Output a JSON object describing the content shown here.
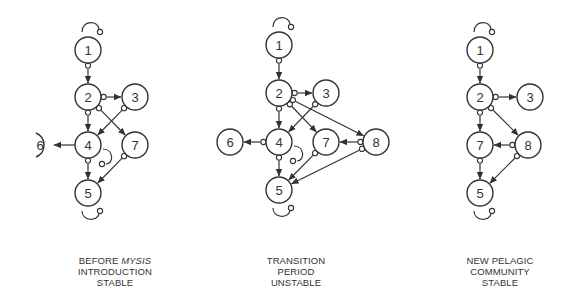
{
  "panels": [
    {
      "id": "before",
      "caption": {
        "line1_prefix": "BEFORE ",
        "line1_italic": "MYSIS",
        "line2": "INTRODUCTION",
        "line3": "STABLE"
      },
      "nodes": [
        {
          "id": "1",
          "x": 88,
          "y": 50
        },
        {
          "id": "2",
          "x": 88,
          "y": 97
        },
        {
          "id": "3",
          "x": 135,
          "y": 97
        },
        {
          "id": "4",
          "x": 88,
          "y": 145
        },
        {
          "id": "6",
          "x": 40,
          "y": 145,
          "partial": true
        },
        {
          "id": "7",
          "x": 135,
          "y": 145
        },
        {
          "id": "5",
          "x": 88,
          "y": 193
        }
      ],
      "edges": [
        {
          "from": "1",
          "to": "2"
        },
        {
          "from": "2",
          "to": "3"
        },
        {
          "from": "2",
          "to": "4"
        },
        {
          "from": "2",
          "to": "7"
        },
        {
          "from": "3",
          "to": "4"
        },
        {
          "from": "4",
          "to": "6",
          "no_tail": true
        },
        {
          "from": "4",
          "to": "5"
        },
        {
          "from": "7",
          "to": "5"
        }
      ],
      "self_loops": [
        "1",
        "4",
        "5"
      ]
    },
    {
      "id": "transition",
      "caption": {
        "line1": "TRANSITION",
        "line2": "PERIOD",
        "line3": "UNSTABLE"
      },
      "nodes": [
        {
          "id": "1",
          "x": 279,
          "y": 45
        },
        {
          "id": "2",
          "x": 279,
          "y": 93
        },
        {
          "id": "3",
          "x": 326,
          "y": 93
        },
        {
          "id": "4",
          "x": 279,
          "y": 142
        },
        {
          "id": "6",
          "x": 230,
          "y": 142
        },
        {
          "id": "7",
          "x": 326,
          "y": 142
        },
        {
          "id": "8",
          "x": 376,
          "y": 142
        },
        {
          "id": "5",
          "x": 279,
          "y": 190
        }
      ],
      "edges": [
        {
          "from": "1",
          "to": "2"
        },
        {
          "from": "2",
          "to": "3"
        },
        {
          "from": "2",
          "to": "4"
        },
        {
          "from": "2",
          "to": "7"
        },
        {
          "from": "2",
          "to": "8"
        },
        {
          "from": "3",
          "to": "4"
        },
        {
          "from": "4",
          "to": "6"
        },
        {
          "from": "4",
          "to": "5"
        },
        {
          "from": "8",
          "to": "7"
        },
        {
          "from": "7",
          "to": "5"
        },
        {
          "from": "8",
          "to": "5"
        }
      ],
      "self_loops": [
        "1",
        "4",
        "5"
      ]
    },
    {
      "id": "after",
      "caption": {
        "line1": "NEW PELAGIC",
        "line2": "COMMUNITY",
        "line3": "STABLE"
      },
      "nodes": [
        {
          "id": "1",
          "x": 480,
          "y": 50
        },
        {
          "id": "2",
          "x": 480,
          "y": 97
        },
        {
          "id": "3",
          "x": 530,
          "y": 97
        },
        {
          "id": "7",
          "x": 480,
          "y": 145
        },
        {
          "id": "8",
          "x": 528,
          "y": 145
        },
        {
          "id": "5",
          "x": 480,
          "y": 193
        }
      ],
      "edges": [
        {
          "from": "1",
          "to": "2"
        },
        {
          "from": "2",
          "to": "3"
        },
        {
          "from": "2",
          "to": "7"
        },
        {
          "from": "2",
          "to": "8"
        },
        {
          "from": "8",
          "to": "7"
        },
        {
          "from": "7",
          "to": "5"
        },
        {
          "from": "8",
          "to": "5"
        }
      ],
      "self_loops": [
        "1",
        "5"
      ]
    }
  ],
  "colors": {
    "stroke": "#333333",
    "background": "#ffffff"
  }
}
